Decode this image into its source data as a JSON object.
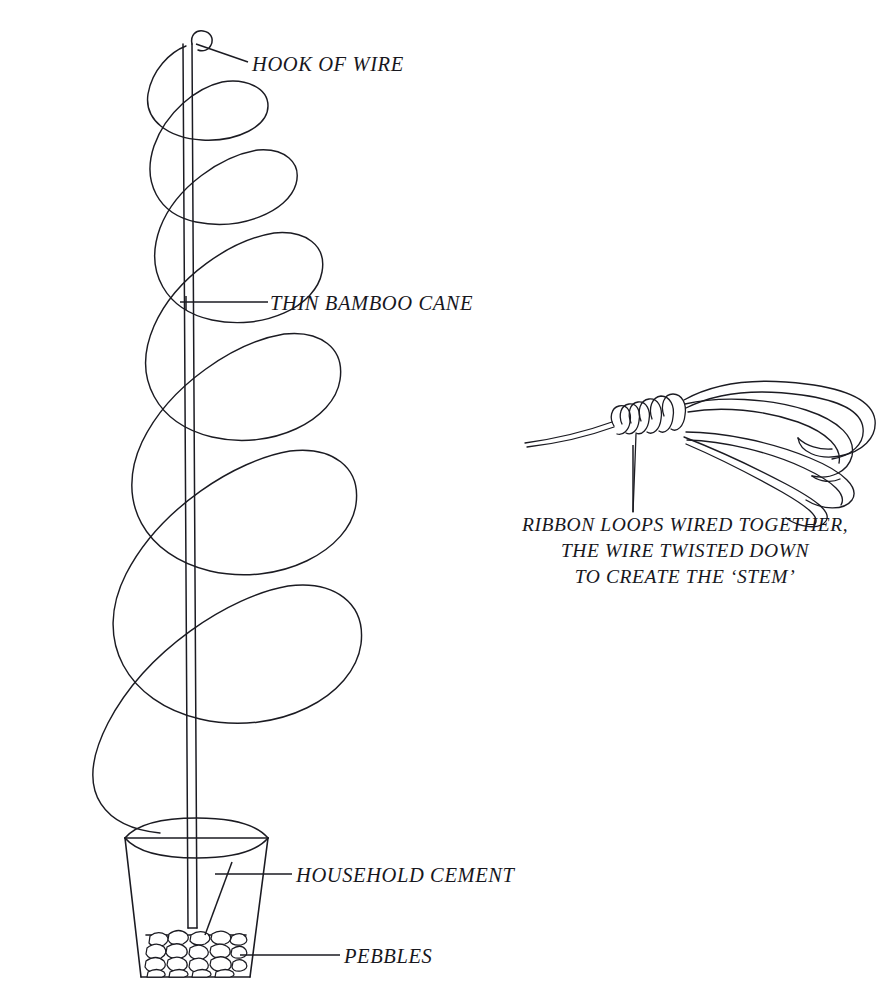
{
  "figure": {
    "background_color": "#ffffff",
    "ink_color": "#1b1b22"
  },
  "labels": {
    "hook_of_wire": "HOOK OF WIRE",
    "thin_bamboo_cane": "THIN BAMBOO CANE",
    "household_cement": "HOUSEHOLD CEMENT",
    "pebbles": "PEBBLES",
    "ribbon_detail_line_1": "RIBBON LOOPS WIRED TOGETHER,",
    "ribbon_detail_line_2": "THE WIRE TWISTED DOWN",
    "ribbon_detail_line_3": "TO CREATE THE ‘STEM’"
  },
  "parts": {
    "spiral_wire": "spiral-wire",
    "bamboo_cane": "bamboo-cane",
    "hook_loop": "hook-loop",
    "plant_pot": "plant-pot",
    "pot_rim": "pot-rim",
    "pebble_bed": "pebble-bed",
    "ribbon_loops": "ribbon-loops",
    "wire_binding": "wire-binding",
    "wire_stem": "wire-stem"
  },
  "counts": {
    "spiral_turns": 7,
    "ribbon_loops": 4,
    "binding_coils": 6
  }
}
